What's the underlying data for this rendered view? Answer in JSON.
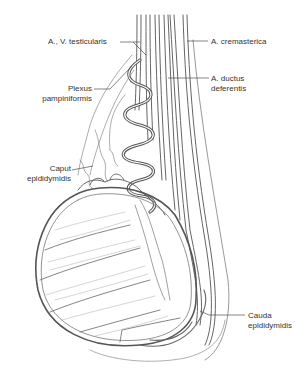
{
  "figure": {
    "type": "anatomical illustration",
    "line_color": "#555555",
    "background": "#ffffff"
  },
  "labels": {
    "testicular_vessels": {
      "lines": [
        "A., V. testicularis"
      ]
    },
    "cremasteric_artery": {
      "lines": [
        "A. cremasterica"
      ]
    },
    "pampiniform_plexus": {
      "lines": [
        "Plexus",
        "pampiniformis"
      ]
    },
    "artery_of_ductus_deferens": {
      "lines": [
        "A. ductus",
        "deferentis"
      ]
    },
    "head_of_epididymis": {
      "lines": [
        "Caput",
        "epididymidis"
      ]
    },
    "tail_of_epididymis": {
      "lines": [
        "Cauda",
        "epididymidis"
      ]
    }
  }
}
